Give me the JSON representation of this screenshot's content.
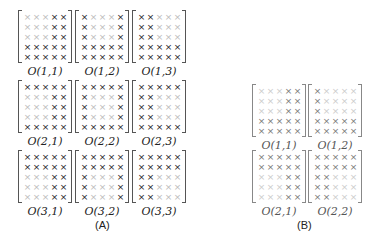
{
  "panel_a": {
    "caption": "(A)",
    "matrices": [
      {
        "label": "O(1,1)",
        "x": 18,
        "y": 10,
        "pattern": [
          "00011",
          "00011",
          "00011",
          "11111",
          "11111"
        ]
      },
      {
        "label": "O(1,2)",
        "x": 75,
        "y": 10,
        "pattern": [
          "10001",
          "10001",
          "10001",
          "11111",
          "11111"
        ]
      },
      {
        "label": "O(1,3)",
        "x": 132,
        "y": 10,
        "pattern": [
          "11000",
          "11000",
          "11000",
          "11111",
          "11111"
        ]
      },
      {
        "label": "O(2,1)",
        "x": 18,
        "y": 80,
        "pattern": [
          "11111",
          "00011",
          "00011",
          "00011",
          "11111"
        ]
      },
      {
        "label": "O(2,2)",
        "x": 75,
        "y": 80,
        "pattern": [
          "11111",
          "10001",
          "10001",
          "10001",
          "11111"
        ]
      },
      {
        "label": "O(2,3)",
        "x": 132,
        "y": 80,
        "pattern": [
          "11111",
          "11000",
          "11000",
          "11000",
          "11111"
        ]
      },
      {
        "label": "O(3,1)",
        "x": 18,
        "y": 150,
        "pattern": [
          "11111",
          "11111",
          "00011",
          "00011",
          "00011"
        ]
      },
      {
        "label": "O(3,2)",
        "x": 75,
        "y": 150,
        "pattern": [
          "11111",
          "11111",
          "10001",
          "10001",
          "10001"
        ]
      },
      {
        "label": "O(3,3)",
        "x": 132,
        "y": 150,
        "pattern": [
          "11111",
          "11111",
          "11000",
          "11000",
          "11000"
        ]
      }
    ]
  },
  "panel_b": {
    "caption": "(B)",
    "matrices": [
      {
        "label": "O(1,1)",
        "x": 252,
        "y": 84,
        "pattern": [
          "00011",
          "00011",
          "00011",
          "11111",
          "11111"
        ]
      },
      {
        "label": "O(1,2)",
        "x": 308,
        "y": 84,
        "pattern": [
          "10000",
          "10000",
          "10000",
          "11111",
          "11111"
        ]
      },
      {
        "label": "O(2,1)",
        "x": 252,
        "y": 150,
        "pattern": [
          "11111",
          "11111",
          "00011",
          "00011",
          "00011"
        ]
      },
      {
        "label": "O(2,2)",
        "x": 308,
        "y": 150,
        "pattern": [
          "11111",
          "11111",
          "11000",
          "11000",
          "11000"
        ]
      }
    ]
  },
  "glyph": "×"
}
